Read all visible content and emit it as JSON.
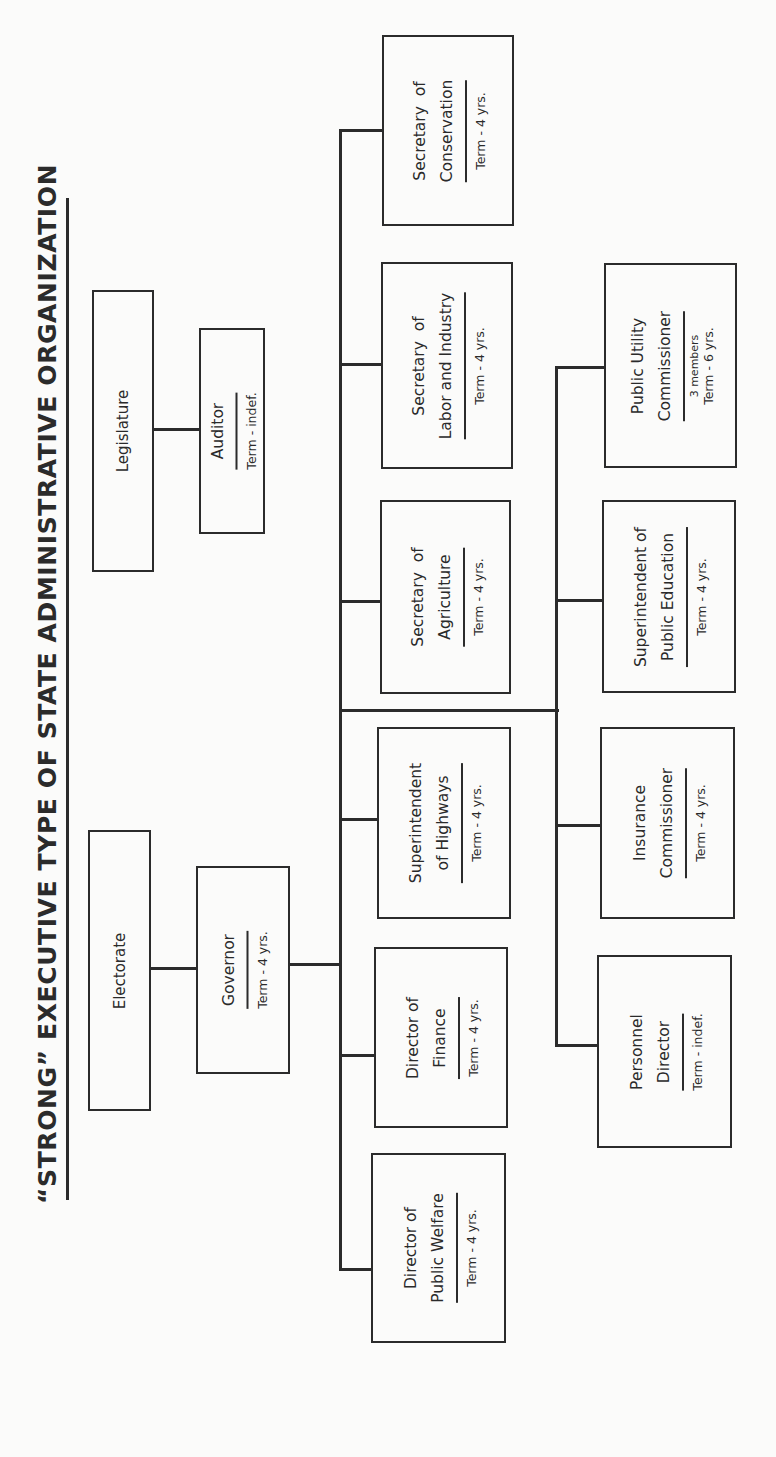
{
  "title": "“STRONG” EXECUTIVE TYPE OF STATE ADMINISTRATIVE ORGANIZATION",
  "nodes": {
    "legislature": {
      "name_lines": [
        "Legislature"
      ]
    },
    "auditor": {
      "name_lines": [
        "Auditor"
      ],
      "term": "Term - indef."
    },
    "electorate": {
      "name_lines": [
        "Electorate"
      ]
    },
    "governor": {
      "name_lines": [
        "Governor"
      ],
      "term": "Term - 4 yrs."
    },
    "conservation": {
      "name_lines": [
        "Secretary  of",
        "Conservation"
      ],
      "term": "Term - 4 yrs."
    },
    "labor": {
      "name_lines": [
        "Secretary  of",
        "Labor and Industry"
      ],
      "term": "Term - 4 yrs."
    },
    "agriculture": {
      "name_lines": [
        "Secretary  of",
        "Agriculture"
      ],
      "term": "Term - 4 yrs."
    },
    "highways": {
      "name_lines": [
        "Superintendent",
        "of Highways"
      ],
      "term": "Term - 4 yrs."
    },
    "finance": {
      "name_lines": [
        "Director of",
        "Finance"
      ],
      "term": "Term - 4 yrs."
    },
    "welfare": {
      "name_lines": [
        "Director of",
        "Public Welfare"
      ],
      "term": "Term - 4 yrs."
    },
    "puc": {
      "name_lines": [
        "Public Utility",
        "Commissioner"
      ],
      "sub": "3 members",
      "term": "Term - 6 yrs."
    },
    "education": {
      "name_lines": [
        "Superintendent of",
        "Public Education"
      ],
      "term": "Term - 4 yrs."
    },
    "insurance": {
      "name_lines": [
        "Insurance",
        "Commissioner"
      ],
      "term": "Term - 4 yrs."
    },
    "personnel": {
      "name_lines": [
        "Personnel",
        "Director"
      ],
      "term": "Term - indef."
    }
  },
  "edges": [
    [
      "legislature",
      "auditor"
    ],
    [
      "electorate",
      "governor"
    ],
    [
      "governor",
      "conservation"
    ],
    [
      "governor",
      "labor"
    ],
    [
      "governor",
      "agriculture"
    ],
    [
      "governor",
      "highways"
    ],
    [
      "governor",
      "finance"
    ],
    [
      "governor",
      "welfare"
    ],
    [
      "governor",
      "puc"
    ],
    [
      "governor",
      "education"
    ],
    [
      "governor",
      "insurance"
    ],
    [
      "governor",
      "personnel"
    ]
  ],
  "colors": {
    "ink": "#2b2b2b",
    "paper": "#fbfbfa"
  }
}
